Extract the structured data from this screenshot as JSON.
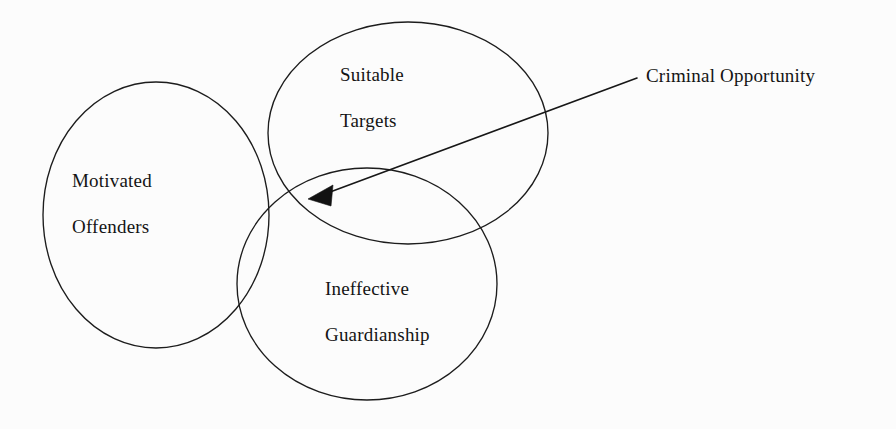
{
  "diagram": {
    "type": "venn-diagram",
    "background_color": "#fcfcfc",
    "stroke_color": "#1c1c1c",
    "sets": [
      {
        "id": "motivated-offenders",
        "label_line_1": "Motivated",
        "label_line_2": "Offenders",
        "cx": 156,
        "cy": 215,
        "rx": 113,
        "ry": 133
      },
      {
        "id": "suitable-targets",
        "label_line_1": "Suitable",
        "label_line_2": "Targets",
        "cx": 408,
        "cy": 133,
        "rx": 140,
        "ry": 111
      },
      {
        "id": "ineffective-guardianship",
        "label_line_1": "Ineffective",
        "label_line_2": "Guardianship",
        "cx": 367,
        "cy": 284,
        "rx": 130,
        "ry": 116
      }
    ],
    "annotation": {
      "id": "criminal-opportunity",
      "text": "Criminal Opportunity",
      "arrow_tip_x": 310,
      "arrow_tip_y": 199,
      "arrow_tail_x": 637,
      "arrow_tail_y": 78
    }
  }
}
